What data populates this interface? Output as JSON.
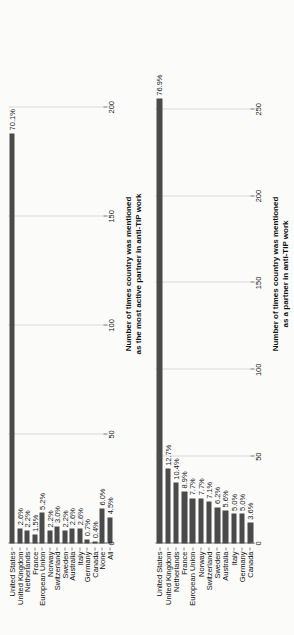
{
  "figure": {
    "orientation": "rotated-90-ccw",
    "bar_color": "#4a4a4a",
    "grid_color": "#d9d9d9",
    "background": "#fbfbfa"
  },
  "chart_data": [
    {
      "id": "most-active-partner",
      "type": "bar",
      "orientation": "horizontal",
      "title": "",
      "xlabel": "Number of times country was mentioned\nas the most active partner in anti-TIP work",
      "xlabel_line1": "Number of times country was mentioned",
      "xlabel_line2": "as the most active partner in anti-TIP work",
      "ylabel": "",
      "xlim": [
        0,
        215
      ],
      "xticks": [
        0,
        50,
        100,
        150,
        200
      ],
      "xticklabels": [
        "0",
        "50",
        "100",
        "150",
        "200"
      ],
      "grid": true,
      "legend": "none",
      "categories": [
        "United States",
        "United Kingdom",
        "Netherlands",
        "France",
        "European Union",
        "Norway",
        "Switzerland",
        "Sweden",
        "Australia",
        "Italy",
        "Germany",
        "Canada",
        "None",
        "All"
      ],
      "data_labels": [
        "70.1%",
        "2.6%",
        "2.2%",
        "1.5%",
        "5.2%",
        "2.2%",
        "3.0%",
        "2.2%",
        "2.6%",
        "2.6%",
        "0.7%",
        "0.4%",
        "6.0%",
        "4.5%"
      ],
      "values": [
        70.1,
        2.6,
        2.2,
        1.5,
        5.2,
        2.2,
        3.0,
        2.2,
        2.6,
        2.6,
        0.7,
        0.4,
        6.0,
        4.5
      ],
      "counts": [
        188,
        7,
        6,
        4,
        14,
        6,
        8,
        6,
        7,
        7,
        2,
        1,
        16,
        12
      ]
    },
    {
      "id": "partner",
      "type": "bar",
      "orientation": "horizontal",
      "title": "",
      "xlabel": "Number of times country was mentioned\nas a partner in anti-TIP work",
      "xlabel_line1": "Number of times country was mentioned",
      "xlabel_line2": "as a partner in anti-TIP work",
      "ylabel": "",
      "xlim": [
        0,
        270
      ],
      "xticks": [
        0,
        50,
        100,
        150,
        200,
        250
      ],
      "xticklabels": [
        "0",
        "50",
        "100",
        "150",
        "200",
        "250"
      ],
      "grid": true,
      "legend": "none",
      "categories": [
        "United States",
        "United Kingdom",
        "Netherlands",
        "France",
        "European Union",
        "Norway",
        "Switzerland",
        "Sweden",
        "Australia",
        "Italy",
        "Germany",
        "Canada"
      ],
      "data_labels": [
        "76.9%",
        "12.7%",
        "10.4%",
        "8.9%",
        "7.7%",
        "7.7%",
        "7.1%",
        "6.2%",
        "5.6%",
        "5.0%",
        "5.0%",
        "3.6%"
      ],
      "values": [
        76.9,
        12.7,
        10.4,
        8.9,
        7.7,
        7.7,
        7.1,
        6.2,
        5.6,
        5.0,
        5.0,
        3.6
      ],
      "counts": [
        259,
        43,
        35,
        30,
        26,
        26,
        24,
        21,
        19,
        17,
        17,
        12
      ]
    }
  ]
}
